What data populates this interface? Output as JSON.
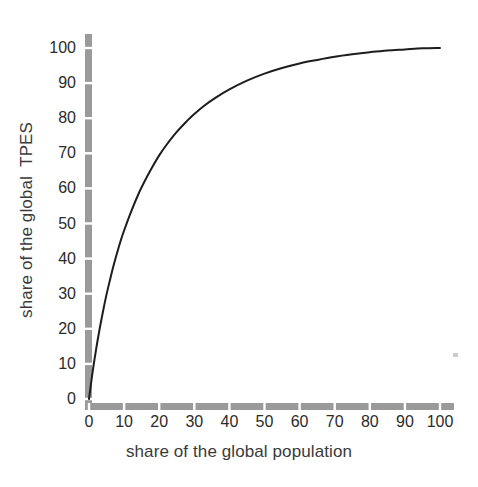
{
  "chart_data": {
    "type": "line",
    "title": "",
    "subtitle": "",
    "xlabel": "share of the global population",
    "ylabel": "share of the global  TPES",
    "xlim": [
      0,
      104
    ],
    "ylim": [
      0,
      104
    ],
    "xticks": [
      0,
      10,
      20,
      30,
      40,
      50,
      60,
      70,
      80,
      90,
      100
    ],
    "yticks": [
      0,
      10,
      20,
      30,
      40,
      50,
      60,
      70,
      80,
      90,
      100
    ],
    "xtick_labels": [
      "0",
      "10",
      "20",
      "30",
      "40",
      "50",
      "60",
      "70",
      "80",
      "90",
      "100"
    ],
    "ytick_labels": [
      "0",
      "10",
      "20",
      "30",
      "40",
      "50",
      "60",
      "70",
      "80",
      "90",
      "100"
    ],
    "grid": false,
    "legend": null,
    "legend_position": "none",
    "annotations": [],
    "series": [
      {
        "name": "cumulative share of global TPES",
        "color": "#1d1d1d",
        "line_width": 2,
        "x": [
          0,
          1,
          2,
          3,
          4,
          5,
          6,
          7,
          8,
          9,
          10,
          12,
          14,
          16,
          18,
          20,
          22,
          25,
          28,
          30,
          33,
          36,
          40,
          45,
          50,
          55,
          60,
          65,
          70,
          75,
          80,
          85,
          90,
          95,
          100
        ],
        "y": [
          0,
          7.5,
          14.0,
          19.8,
          25.0,
          29.8,
          34.0,
          38.0,
          41.6,
          45.0,
          48.0,
          53.4,
          58.2,
          62.3,
          66.0,
          69.4,
          72.3,
          76.1,
          79.3,
          81.2,
          83.7,
          85.8,
          88.2,
          90.7,
          92.7,
          94.3,
          95.6,
          96.6,
          97.5,
          98.2,
          98.8,
          99.3,
          99.6,
          99.9,
          100.0
        ]
      }
    ]
  },
  "axes": {
    "axis_color": "#9a9a9a",
    "curve_color": "#1d1d1d",
    "background_color": "#ffffff",
    "tick_style": "segmented-gray"
  },
  "figure": {
    "artifact_label": "scan-speck"
  }
}
